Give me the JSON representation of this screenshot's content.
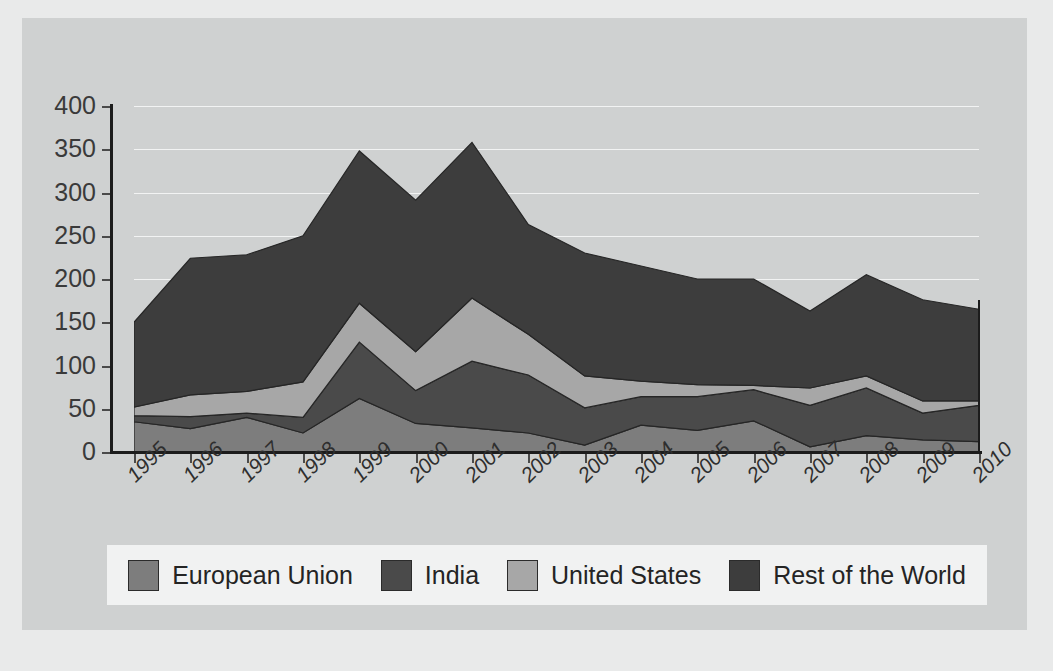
{
  "chart_data": {
    "type": "area",
    "stacked": true,
    "title": "",
    "xlabel": "",
    "ylabel": "",
    "categories": [
      "1995",
      "1996",
      "1997",
      "1998",
      "1999",
      "2000",
      "2001",
      "2002",
      "2003",
      "2004",
      "2005",
      "2006",
      "2007",
      "2008",
      "2009",
      "2010"
    ],
    "ylim": [
      0,
      400
    ],
    "ytick_step": 50,
    "yticks": [
      0,
      50,
      100,
      150,
      200,
      250,
      300,
      350,
      400
    ],
    "grid": true,
    "legend_position": "bottom",
    "series": [
      {
        "name": "European Union",
        "color": "#7d7d7d",
        "values": [
          35,
          27,
          40,
          22,
          62,
          33,
          28,
          22,
          8,
          31,
          25,
          36,
          6,
          19,
          14,
          12
        ]
      },
      {
        "name": "India",
        "color": "#4a4a4a",
        "values": [
          7,
          14,
          5,
          18,
          65,
          38,
          77,
          67,
          43,
          33,
          39,
          36,
          48,
          55,
          31,
          42
        ]
      },
      {
        "name": "United States",
        "color": "#a7a7a7",
        "values": [
          10,
          25,
          25,
          41,
          45,
          45,
          73,
          47,
          37,
          18,
          14,
          5,
          20,
          14,
          14,
          5
        ]
      },
      {
        "name": "Rest of the World",
        "color": "#3d3d3d",
        "values": [
          98,
          158,
          158,
          169,
          176,
          175,
          180,
          127,
          142,
          133,
          122,
          123,
          89,
          117,
          117,
          106
        ]
      }
    ],
    "totals": [
      150,
      224,
      228,
      250,
      348,
      291,
      358,
      263,
      230,
      215,
      200,
      200,
      163,
      205,
      176,
      165
    ]
  },
  "axis": {
    "y_labels": [
      "400",
      "350",
      "300",
      "250",
      "200",
      "150",
      "100",
      "50",
      "0"
    ],
    "x_labels": [
      "1995",
      "1996",
      "1997",
      "1998",
      "1999",
      "2000",
      "2001",
      "2002",
      "2003",
      "2004",
      "2005",
      "2006",
      "2007",
      "2008",
      "2009",
      "2010"
    ]
  },
  "legend": {
    "items": [
      {
        "label": "European Union",
        "color": "#7d7d7d"
      },
      {
        "label": "India",
        "color": "#4a4a4a"
      },
      {
        "label": "United States",
        "color": "#a7a7a7"
      },
      {
        "label": "Rest of the World",
        "color": "#3d3d3d"
      }
    ]
  },
  "colors": {
    "page_background": "#e9eaea",
    "panel_background": "#cfd1d1",
    "legend_background": "#f1f2f2",
    "axis": "#1c1c1c",
    "gridline": "#f2f3f3",
    "text": "#2e2e2e"
  }
}
